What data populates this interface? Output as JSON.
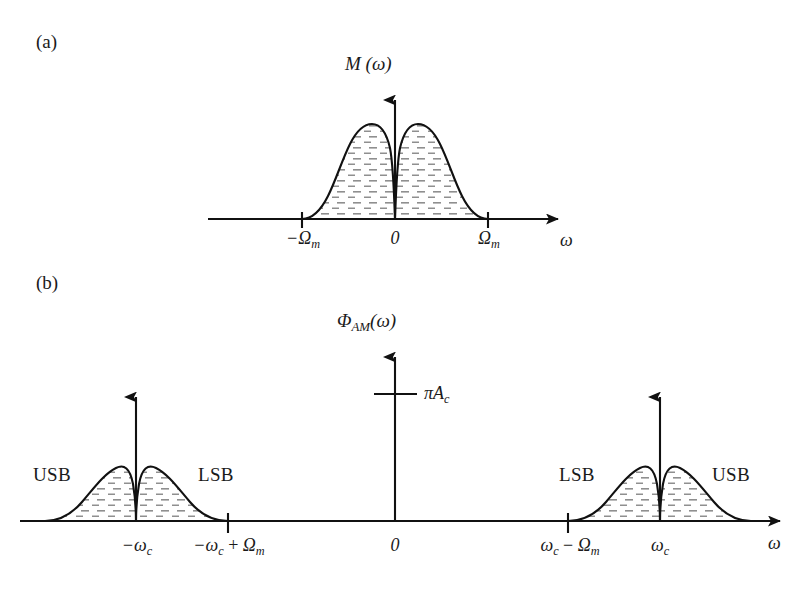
{
  "figure": {
    "panels": [
      {
        "id": "a",
        "label": "(a)",
        "y_axis_title": "M (ω)",
        "x_axis_title": "ω",
        "ticks": [
          {
            "name": "neg-omega-m",
            "text_html": "−Ω<sub>m</sub>"
          },
          {
            "name": "origin",
            "text_html": "0"
          },
          {
            "name": "pos-omega-m",
            "text_html": "Ω<sub>m</sub>"
          }
        ]
      },
      {
        "id": "b",
        "label": "(b)",
        "y_axis_title": "Φ",
        "y_axis_title_sub": "AM",
        "y_axis_title_tail": "(ω)",
        "x_axis_title": "ω",
        "impulse_value_html": "πA<sub>c</sub>",
        "sideband_labels": [
          {
            "name": "usb-left",
            "text": "USB"
          },
          {
            "name": "lsb-left",
            "text": "LSB"
          },
          {
            "name": "lsb-right",
            "text": "LSB"
          },
          {
            "name": "usb-right",
            "text": "USB"
          }
        ],
        "ticks": [
          {
            "name": "neg-omega-c",
            "text_html": "−ω<sub>c</sub>"
          },
          {
            "name": "neg-omega-c-plus-omega-m",
            "text_html": "−ω<sub>c</sub> <span class=\"up\">+</span> Ω<sub>m</sub>"
          },
          {
            "name": "origin",
            "text_html": "0"
          },
          {
            "name": "omega-c-minus-omega-m",
            "text_html": "ω<sub>c</sub> <span class=\"up\">−</span> Ω<sub>m</sub>"
          },
          {
            "name": "omega-c",
            "text_html": "ω<sub>c</sub>"
          }
        ]
      }
    ]
  },
  "chart_data": {
    "type": "line",
    "charts": [
      {
        "name": "panel-a-baseband-spectrum",
        "title": "M (ω)",
        "xlabel": "ω",
        "ylabel": "M (ω)",
        "grid": false,
        "legend": null,
        "description": "Bimodal baseband magnitude spectrum, even-symmetric about 0, with a deep notch at dc and zero outside ±Ωm",
        "xticks": [
          "−Ωm",
          "0",
          "Ωm"
        ],
        "xtick_values": [
          -1,
          0,
          1
        ],
        "xlim": [
          -1.9,
          1.9
        ],
        "ylim": [
          0,
          1.12
        ],
        "series": [
          {
            "name": "M(omega)",
            "x": [
              -1.0,
              -0.92,
              -0.84,
              -0.76,
              -0.68,
              -0.6,
              -0.52,
              -0.44,
              -0.36,
              -0.28,
              -0.2,
              -0.14,
              -0.08,
              -0.04,
              0.0,
              0.04,
              0.08,
              0.14,
              0.2,
              0.28,
              0.36,
              0.44,
              0.52,
              0.6,
              0.68,
              0.76,
              0.84,
              0.92,
              1.0
            ],
            "y": [
              0.0,
              0.12,
              0.3,
              0.48,
              0.65,
              0.8,
              0.91,
              0.98,
              1.0,
              0.96,
              0.84,
              0.7,
              0.45,
              0.22,
              0.0,
              0.22,
              0.45,
              0.7,
              0.84,
              0.96,
              1.0,
              0.98,
              0.91,
              0.8,
              0.65,
              0.48,
              0.3,
              0.12,
              0.0
            ]
          }
        ]
      },
      {
        "name": "panel-b-am-spectrum",
        "title": "ΦAM (ω)",
        "xlabel": "ω",
        "ylabel": "ΦAM (ω)",
        "grid": false,
        "legend": null,
        "description": "AM spectrum: baseband shape translated to ±ωc plus carrier impulses of area πAc at ±ωc",
        "xticks": [
          "−ωc",
          "−ωc + Ωm",
          "0",
          "ωc − Ωm",
          "ωc"
        ],
        "xtick_values": [
          -1.0,
          -0.5,
          0.0,
          0.5,
          1.0
        ],
        "xlim": [
          -1.55,
          1.55
        ],
        "ylim": [
          0,
          1.05
        ],
        "impulses": [
          {
            "x": -1.0,
            "label": "πAc",
            "height": 0.82
          },
          {
            "x": 1.0,
            "label": "πAc",
            "height": 0.82
          }
        ],
        "sidebands": [
          {
            "name": "USB",
            "center": -1.0,
            "side": "left",
            "span": [
              -1.5,
              -1.0
            ]
          },
          {
            "name": "LSB",
            "center": -1.0,
            "side": "right",
            "span": [
              -1.0,
              -0.5
            ]
          },
          {
            "name": "LSB",
            "center": 1.0,
            "side": "left",
            "span": [
              0.5,
              1.0
            ]
          },
          {
            "name": "USB",
            "center": 1.0,
            "side": "right",
            "span": [
              1.0,
              1.5
            ]
          }
        ],
        "series": [
          {
            "name": "Phi_AM(omega) continuous part",
            "x": [
              -1.5,
              -1.44,
              -1.38,
              -1.32,
              -1.26,
              -1.2,
              -1.14,
              -1.1,
              -1.06,
              -1.03,
              -1.0,
              -0.97,
              -0.94,
              -0.9,
              -0.86,
              -0.8,
              -0.74,
              -0.68,
              -0.62,
              -0.56,
              -0.5,
              0.5,
              0.56,
              0.62,
              0.68,
              0.74,
              0.8,
              0.86,
              0.9,
              0.94,
              0.97,
              1.0,
              1.03,
              1.06,
              1.1,
              1.14,
              1.2,
              1.26,
              1.32,
              1.38,
              1.44,
              1.5
            ],
            "y": [
              0.0,
              0.1,
              0.26,
              0.44,
              0.6,
              0.74,
              0.83,
              0.78,
              0.58,
              0.3,
              0.0,
              0.3,
              0.58,
              0.78,
              0.83,
              0.74,
              0.6,
              0.44,
              0.26,
              0.1,
              0.0,
              0.0,
              0.1,
              0.26,
              0.44,
              0.6,
              0.74,
              0.83,
              0.78,
              0.58,
              0.3,
              0.0,
              0.3,
              0.58,
              0.78,
              0.83,
              0.74,
              0.6,
              0.44,
              0.26,
              0.1,
              0.0
            ]
          }
        ]
      }
    ]
  },
  "style": {
    "stroke": "#111111",
    "hatch": "#8a8a8a",
    "background": "#ffffff"
  }
}
